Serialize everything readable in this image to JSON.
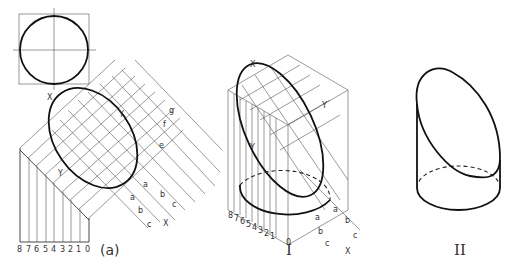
{
  "figure": {
    "panel_a_label": "(a)",
    "panel_1_label": "I",
    "panel_2_label": "II",
    "axis_x": "X",
    "axis_y": "Y",
    "scale_numbers": [
      "8",
      "7",
      "6",
      "5",
      "4",
      "3",
      "2",
      "1",
      "0"
    ],
    "dimension_labels": [
      "a",
      "a",
      "b",
      "b",
      "c",
      "c",
      "e",
      "f",
      "g"
    ],
    "colors": {
      "line": "#111111",
      "construction": "#555555",
      "background": "#ffffff"
    }
  }
}
